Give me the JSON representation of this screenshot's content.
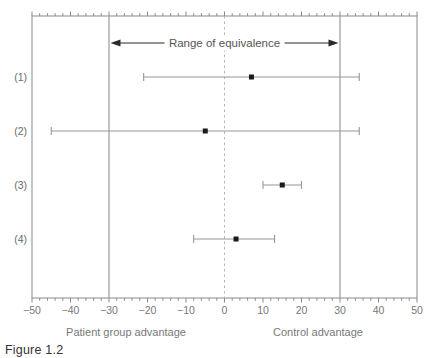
{
  "caption": "Figure 1.2",
  "chart_data": {
    "type": "scatter",
    "variant": "horizontal-errorbar-forest",
    "title": "",
    "annotation": "Range of equivalence",
    "equivalence_range": [
      -30,
      30
    ],
    "zero_line": 0,
    "xlim": [
      -50,
      50
    ],
    "x_major_ticks": [
      -50,
      -40,
      -30,
      -20,
      -10,
      0,
      10,
      20,
      30,
      40,
      50
    ],
    "minor_tick_step": 2,
    "xlabel_left": "Patient group advantage",
    "xlabel_right": "Control advantage",
    "grid": false,
    "legend": "none",
    "series": [
      {
        "label": "(1)",
        "point": 7,
        "lower": -21,
        "upper": 35
      },
      {
        "label": "(2)",
        "point": -5,
        "lower": -45,
        "upper": 35
      },
      {
        "label": "(3)",
        "point": 15,
        "lower": 10,
        "upper": 20
      },
      {
        "label": "(4)",
        "point": 3,
        "lower": -8,
        "upper": 13
      }
    ],
    "colors": {
      "frame": "#8a8a8a",
      "equivalence_lines": "#9a9a9a",
      "zero_dash": "#b5b5b5",
      "errorbar": "#989898",
      "marker": "#1a1a1a",
      "arrow": "#2a2a2a",
      "text_gray": "#787878",
      "caption_text": "#333333",
      "background": "#ffffff"
    }
  }
}
